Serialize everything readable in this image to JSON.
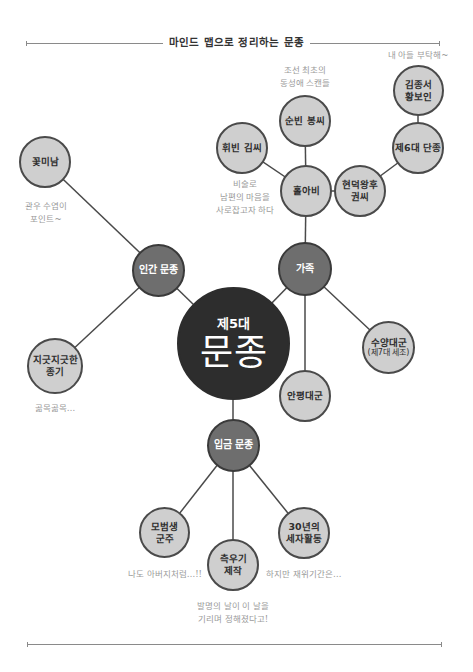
{
  "header": {
    "title": "마인드 맵으로 정리하는 문종"
  },
  "center": {
    "subtitle": "제5대",
    "title": "문종"
  },
  "colors": {
    "core": "#2d2d2d",
    "branch": "#6e6e6e",
    "leaf": "#cfcfcf",
    "line": "#4a4a4a",
    "note": "#9a9a9a"
  },
  "branches": {
    "human": {
      "label": "인간 문종"
    },
    "family": {
      "label": "가족"
    },
    "king": {
      "label": "입금 문종"
    }
  },
  "nodes": {
    "flower_boy": {
      "label": "꽃미남"
    },
    "persistent": {
      "label_line1": "지긋지긋한",
      "label_line2": "종기"
    },
    "widower": {
      "label": "홀아비"
    },
    "hwibin": {
      "label": "휘빈 김씨"
    },
    "sunbin": {
      "label": "순빈 봉씨"
    },
    "hyeondeok": {
      "label_line1": "현덕왕후",
      "label_line2": "권씨"
    },
    "danjong": {
      "label": "제6대 단종"
    },
    "kimjongseo": {
      "label_line1": "김종서",
      "label_line2": "황보인"
    },
    "suyang": {
      "label": "수양대군",
      "sub": "(제7대 세조)"
    },
    "anpyeong": {
      "label": "안평대군"
    },
    "model": {
      "label_line1": "모범생",
      "label_line2": "군주"
    },
    "rain_gauge": {
      "label_line1": "측우기",
      "label_line2": "제작"
    },
    "crown_prince": {
      "label_line1": "30년의",
      "label_line2": "세자활동"
    }
  },
  "notes": {
    "flower_boy": "관우 수염이\n포인트~",
    "persistent": "곪목곪목…",
    "sunbin": "조선 최초의\n동성애 스캔들",
    "hwibin": "비술로\n남편의 마음을\n사로잡고자 하다",
    "kimjongseo": "내 아들 부탁해~",
    "model": "나도 아버지처럼…!!",
    "rain_gauge": "발명의 날이 이 날을\n기리며 정해졌다고!",
    "crown_prince": "하지만 재위기간은…"
  }
}
